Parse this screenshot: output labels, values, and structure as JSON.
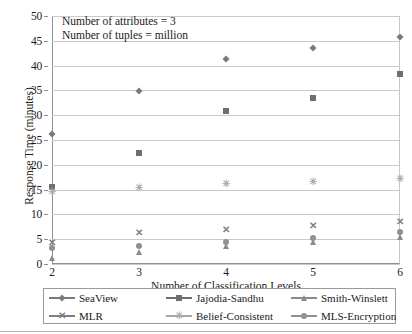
{
  "chart_data": {
    "type": "line",
    "title": "",
    "xlabel": "Number of Classification Levels",
    "ylabel": "Response Time (minutes)",
    "x": [
      2,
      3,
      4,
      5,
      6
    ],
    "xtick_labels": [
      "2",
      "3",
      "4",
      "5",
      "6"
    ],
    "ytick_labels": [
      "0",
      "5",
      "10",
      "15",
      "20",
      "25",
      "30",
      "35",
      "40",
      "45",
      "50"
    ],
    "yticks": [
      0,
      5,
      10,
      15,
      20,
      25,
      30,
      35,
      40,
      45,
      50
    ],
    "xlim": [
      2,
      6
    ],
    "ylim": [
      0,
      50
    ],
    "grid": "horizontal",
    "legend_position": "bottom",
    "annotations": [
      "Number of attributes = 3",
      "Number of tuples = million"
    ],
    "series": [
      {
        "name": "SeaView",
        "marker": "diamond",
        "color": "#7a7a7a",
        "values": [
          26.2,
          34.8,
          41.3,
          43.6,
          45.8
        ]
      },
      {
        "name": "Jajodia-Sandhu",
        "marker": "square",
        "color": "#6e6e6e",
        "values": [
          15.6,
          22.3,
          30.8,
          33.4,
          38.4
        ]
      },
      {
        "name": "Smith-Winslett",
        "marker": "triangle",
        "color": "#8a8a8a",
        "values": [
          1.2,
          2.5,
          3.6,
          4.5,
          5.5
        ]
      },
      {
        "name": "MLR",
        "marker": "x",
        "color": "#7f7f7f",
        "values": [
          4.3,
          6.2,
          6.9,
          7.6,
          8.5
        ]
      },
      {
        "name": "Belief-Consistent",
        "marker": "star",
        "color": "#a9a9a9",
        "values": [
          14.5,
          15.3,
          16.1,
          16.5,
          17.1
        ]
      },
      {
        "name": "MLS-Encryption",
        "marker": "circle",
        "color": "#909090",
        "values": [
          3.3,
          3.6,
          4.4,
          5.3,
          6.4
        ]
      }
    ]
  }
}
